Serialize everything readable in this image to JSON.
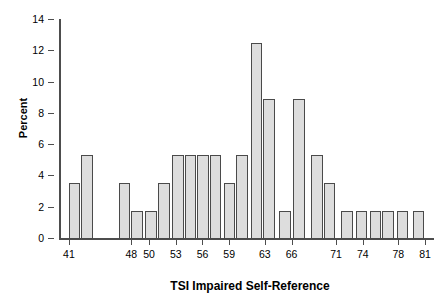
{
  "chart_data": {
    "type": "bar",
    "title": "",
    "xlabel": "TSI Impaired Self-Reference",
    "ylabel": "Percent",
    "ylim": [
      0,
      14
    ],
    "yticks": [
      0,
      2,
      4,
      6,
      8,
      10,
      12,
      14
    ],
    "ytick_labels": [
      "0",
      "2",
      "4",
      "6",
      "8",
      "10",
      "12",
      "14"
    ],
    "xlim": [
      40,
      82
    ],
    "xticks": [
      41,
      48,
      50,
      53,
      56,
      59,
      63,
      66,
      71,
      74,
      78,
      81
    ],
    "xtick_labels": [
      "41",
      "48",
      "50",
      "53",
      "56",
      "59",
      "63",
      "66",
      "71",
      "74",
      "78",
      "81"
    ],
    "grid": false,
    "legend": null,
    "bar_color": "#dddddd",
    "bar_edge_color": "#4a4a4a",
    "axis_color": "#4d4d4d",
    "bin_width": 1.5,
    "categories": [
      "41",
      "42.5",
      "46.5",
      "48",
      "49.5",
      "51",
      "52.5",
      "54",
      "55.5",
      "57",
      "58.5",
      "60",
      "61.5",
      "63",
      "64.5",
      "66",
      "67.5",
      "69",
      "70.5",
      "73.5",
      "75",
      "76.5",
      "78",
      "80.5"
    ],
    "values": [
      3.57,
      5.36,
      3.57,
      1.79,
      1.79,
      3.57,
      5.36,
      5.36,
      5.36,
      5.36,
      3.57,
      5.36,
      12.5,
      8.93,
      1.79,
      8.93,
      5.36,
      3.57,
      1.79,
      1.79,
      1.79,
      1.79,
      1.79,
      1.79
    ],
    "bars": [
      {
        "left": 41.0,
        "right": 42.3,
        "value": 3.57
      },
      {
        "left": 42.4,
        "right": 43.7,
        "value": 5.36
      },
      {
        "left": 46.6,
        "right": 47.9,
        "value": 3.57
      },
      {
        "left": 48.0,
        "right": 49.3,
        "value": 1.79
      },
      {
        "left": 49.6,
        "right": 50.9,
        "value": 1.79
      },
      {
        "left": 51.0,
        "right": 52.3,
        "value": 3.57
      },
      {
        "left": 52.6,
        "right": 53.9,
        "value": 5.36
      },
      {
        "left": 54.0,
        "right": 55.3,
        "value": 5.36
      },
      {
        "left": 55.4,
        "right": 56.7,
        "value": 5.36
      },
      {
        "left": 56.8,
        "right": 58.1,
        "value": 5.36
      },
      {
        "left": 58.4,
        "right": 59.7,
        "value": 3.57
      },
      {
        "left": 59.8,
        "right": 61.1,
        "value": 5.36
      },
      {
        "left": 61.4,
        "right": 62.7,
        "value": 12.5
      },
      {
        "left": 62.8,
        "right": 64.1,
        "value": 8.93
      },
      {
        "left": 64.6,
        "right": 65.9,
        "value": 1.79
      },
      {
        "left": 66.2,
        "right": 67.5,
        "value": 8.93
      },
      {
        "left": 68.2,
        "right": 69.5,
        "value": 5.36
      },
      {
        "left": 69.6,
        "right": 70.9,
        "value": 3.57
      },
      {
        "left": 71.6,
        "right": 72.9,
        "value": 1.79
      },
      {
        "left": 73.2,
        "right": 74.5,
        "value": 1.79
      },
      {
        "left": 74.8,
        "right": 76.1,
        "value": 1.79
      },
      {
        "left": 76.2,
        "right": 77.5,
        "value": 1.79
      },
      {
        "left": 77.8,
        "right": 79.1,
        "value": 1.79
      },
      {
        "left": 79.6,
        "right": 80.9,
        "value": 1.79
      }
    ]
  }
}
